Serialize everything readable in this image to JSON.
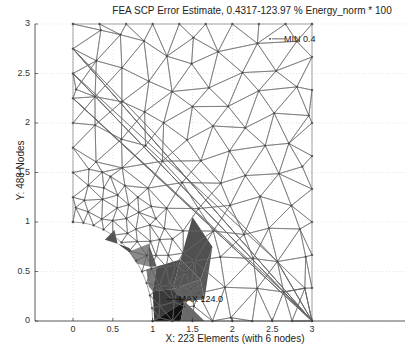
{
  "chart_data": {
    "type": "mesh",
    "title": "FEA SCP Error Estimate, 0.4317-123.97 % Energy_norm * 100",
    "xlabel": "X: 223 Elements (with 6 nodes)",
    "ylabel": "Y: 488 Nodes",
    "xlim": [
      -0.45,
      3.4
    ],
    "ylim": [
      0,
      3
    ],
    "xticks": [
      "0",
      "0.5",
      "1",
      "1.5",
      "2",
      "2.5",
      "3"
    ],
    "xtick_values": [
      0,
      0.5,
      1,
      1.5,
      2,
      2.5,
      3
    ],
    "yticks": [
      "0",
      "0.5",
      "1",
      "1.5",
      "2",
      "2.5",
      "3"
    ],
    "ytick_values": [
      0,
      0.5,
      1,
      1.5,
      2,
      2.5,
      3
    ],
    "grid": true,
    "domain": "Quarter plate 3x3 with circular hole of radius 1 at origin",
    "error_range": {
      "min": 0.4317,
      "max": 123.97,
      "units": "% Energy_norm * 100"
    },
    "annotations": [
      {
        "label": "MIN",
        "value": "0.4",
        "x": 2.75,
        "y": 2.85
      },
      {
        "label": "MAX",
        "value": "124.0",
        "x": 1.35,
        "y": 0.22
      }
    ],
    "elements": 223,
    "nodes": 488,
    "element_type": "6-node triangle",
    "shaded_elements": [
      {
        "pts": [
          [
            0.52,
            0.92
          ],
          [
            0.4,
            0.82
          ],
          [
            0.56,
            0.78
          ]
        ],
        "shade": "#555555"
      },
      {
        "pts": [
          [
            0.56,
            0.78
          ],
          [
            0.7,
            0.7
          ],
          [
            0.85,
            0.63
          ],
          [
            0.7,
            0.74
          ]
        ],
        "shade": "#4a4a4a"
      },
      {
        "pts": [
          [
            0.7,
            0.7
          ],
          [
            0.95,
            0.78
          ],
          [
            0.95,
            0.55
          ],
          [
            0.8,
            0.58
          ]
        ],
        "shade": "#8a8a8a"
      },
      {
        "pts": [
          [
            0.95,
            0.78
          ],
          [
            1.05,
            0.55
          ],
          [
            0.95,
            0.55
          ]
        ],
        "shade": "#5a5a5a"
      },
      {
        "pts": [
          [
            0.92,
            0.52
          ],
          [
            1.05,
            0.55
          ],
          [
            1.0,
            0.3
          ],
          [
            0.95,
            0.35
          ]
        ],
        "shade": "#7a7a7a"
      },
      {
        "pts": [
          [
            1.05,
            0.55
          ],
          [
            1.35,
            0.62
          ],
          [
            1.25,
            0.32
          ],
          [
            1.0,
            0.3
          ]
        ],
        "shade": "#4d4d4d"
      },
      {
        "pts": [
          [
            1.35,
            0.62
          ],
          [
            1.6,
            0.42
          ],
          [
            1.25,
            0.32
          ]
        ],
        "shade": "#555555"
      },
      {
        "pts": [
          [
            1.5,
            1.05
          ],
          [
            1.35,
            0.62
          ],
          [
            1.6,
            0.42
          ],
          [
            1.75,
            0.75
          ]
        ],
        "shade": "#505050"
      },
      {
        "pts": [
          [
            1.6,
            0.42
          ],
          [
            1.75,
            0.75
          ],
          [
            1.65,
            0.22
          ]
        ],
        "shade": "#595959"
      },
      {
        "pts": [
          [
            1.25,
            0.32
          ],
          [
            1.6,
            0.42
          ],
          [
            1.65,
            0.22
          ],
          [
            1.4,
            0.2
          ]
        ],
        "shade": "#5e5e5e"
      },
      {
        "pts": [
          [
            1.0,
            0.3
          ],
          [
            1.25,
            0.32
          ],
          [
            1.4,
            0.2
          ],
          [
            1.02,
            0.0
          ]
        ],
        "shade": "#3a3a3a"
      },
      {
        "pts": [
          [
            1.02,
            0.0
          ],
          [
            1.4,
            0.2
          ],
          [
            1.35,
            0.0
          ]
        ],
        "shade": "#111111"
      },
      {
        "pts": [
          [
            1.35,
            0.0
          ],
          [
            1.4,
            0.2
          ],
          [
            1.65,
            0.0
          ]
        ],
        "shade": "#6a6a6a"
      }
    ]
  },
  "annotations": {
    "min_label": "MIN",
    "min_value": "0.4",
    "max_label": "MAX",
    "max_value": "124.0"
  }
}
